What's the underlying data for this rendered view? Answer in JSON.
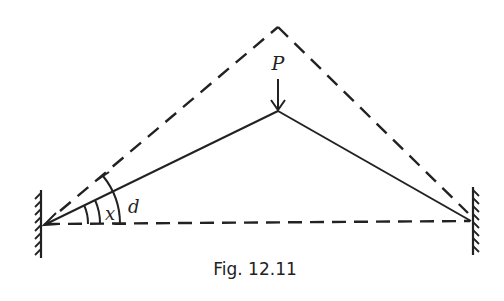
{
  "figure": {
    "caption": "Fig. 12.11",
    "labels": {
      "load": "P",
      "angle_inner": "x",
      "angle_outer": "d"
    },
    "colors": {
      "stroke": "#222222",
      "background": "#ffffff"
    },
    "elements": [
      "left fixed wall support (hatched)",
      "right fixed wall support (hatched)",
      "dashed horizontal baseline between supports",
      "dashed outer triangle to upper apex",
      "solid loaded strut triangle to lower apex",
      "downward load arrow P at lower apex",
      "angle arc x between baseline and solid strut",
      "angle arc d between baseline and dashed line"
    ]
  }
}
